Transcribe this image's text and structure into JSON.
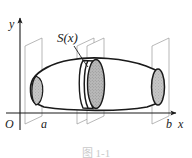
{
  "figure": {
    "caption": "图 1-1",
    "axes": {
      "y_label": "y",
      "x_label": "x",
      "origin_label": "O",
      "left_bound_label": "a",
      "right_bound_label": "b"
    },
    "annotations": {
      "cross_section_label": "S(x)"
    },
    "colors": {
      "stroke": "#1a1a1a",
      "thin_stroke": "#8c8c8c",
      "cross_section_fill": "#b3b3b3",
      "cap_fill": "#c4c4c4",
      "background": "#ffffff",
      "caption_color": "#c9c9c9"
    }
  }
}
